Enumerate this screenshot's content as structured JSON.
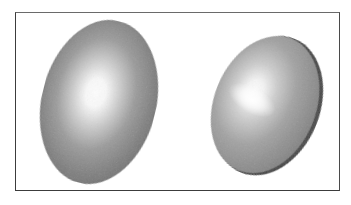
{
  "figure": {
    "frame": {
      "border_color": "#3c3c3c",
      "background": "#ffffff"
    },
    "shapes": [
      {
        "name": "left-ellipsoid",
        "kind": "shaded-ellipsoid",
        "center": [
          99,
          102
        ],
        "radii": [
          57,
          83
        ],
        "rotation_deg": 14,
        "highlight_center": [
          93,
          97
        ],
        "highlight_shape": "round",
        "base_color": "#6e6e6e",
        "highlight_color": "#ffffff"
      },
      {
        "name": "right-ellipsoid",
        "kind": "shaded-disc",
        "center": [
          266,
          105
        ],
        "radii": [
          52,
          72
        ],
        "rotation_deg": 22,
        "highlight_center": [
          250,
          100
        ],
        "highlight_shape": "elongated-diagonal",
        "base_color": "#7a7a7a",
        "highlight_color": "#ffffff",
        "rim_color": "#3e3e3e"
      }
    ]
  }
}
